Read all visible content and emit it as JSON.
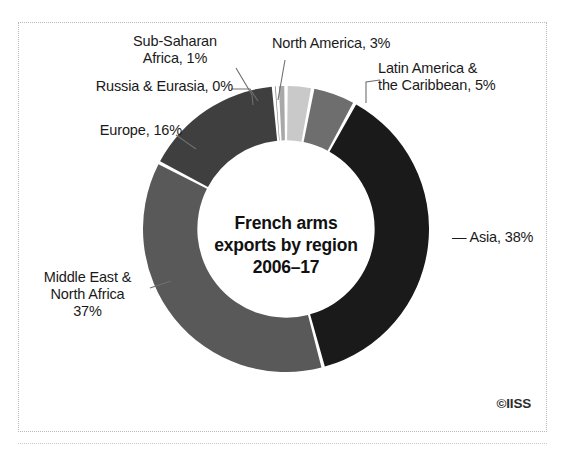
{
  "figure": {
    "credit": "©IISS",
    "center_title_lines": [
      "French arms",
      "exports by region",
      "2006–17"
    ]
  },
  "labels": {
    "sub_saharan_africa": [
      "Sub-Saharan",
      "Africa, 1%"
    ],
    "north_america": [
      "North America, 3%"
    ],
    "latin_america": [
      "Latin America &",
      "the Caribbean, 5%"
    ],
    "russia_eurasia": [
      "Russia & Eurasia, 0%"
    ],
    "europe": [
      "Europe, 16%"
    ],
    "middle_east": [
      "Middle East &",
      "North Africa",
      "37%"
    ],
    "asia": [
      "— Asia, 38%"
    ]
  },
  "chart_data": {
    "type": "pie",
    "variant": "donut",
    "title": "French arms exports by region 2006–17",
    "subtitle": "",
    "xlabel": "",
    "ylabel": "",
    "units": "percent of total French arms exports",
    "period": "2006–17",
    "legend_position": "outside-labels-with-leader-lines",
    "grid": false,
    "total": 100,
    "start_angle_deg": 0,
    "direction": "clockwise",
    "inner_radius_ratio": 0.62,
    "categories": [
      "North America",
      "Latin America & the Caribbean",
      "Asia",
      "Middle East & North Africa",
      "Europe",
      "Russia & Eurasia",
      "Sub-Saharan Africa"
    ],
    "values": [
      3,
      5,
      38,
      37,
      16,
      0.4,
      1
    ],
    "labels_displayed": [
      "North America, 3%",
      "Latin America & the Caribbean, 5%",
      "Asia, 38%",
      "Middle East & North Africa 37%",
      "Europe, 16%",
      "Russia & Eurasia, 0%",
      "Sub-Saharan Africa, 1%"
    ],
    "colors": [
      "#c9c9c9",
      "#6e6e6e",
      "#1a1a1a",
      "#595959",
      "#3f3f3f",
      "#8a8a8a",
      "#a8a8a8"
    ],
    "slice_gap_color": "#ffffff"
  },
  "style": {
    "frame_border": "#b9b9b9",
    "background": "#ffffff",
    "text": "#1a1a1a",
    "asia_color": "#1a1a1a",
    "middle_east_color": "#595959",
    "europe_color": "#3f3f3f",
    "latin_america_color": "#6e6e6e",
    "north_america_color": "#c9c9c9",
    "sub_saharan_color": "#a8a8a8",
    "russia_color": "#8a8a8a"
  }
}
